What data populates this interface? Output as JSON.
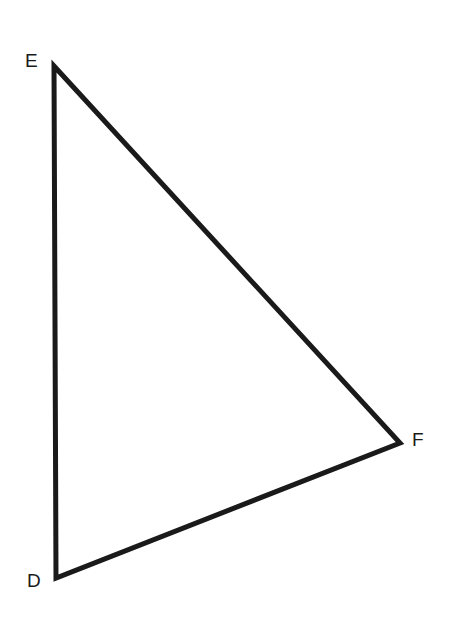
{
  "diagram": {
    "type": "triangle",
    "stroke_color": "#1a1a1a",
    "stroke_width": 5,
    "vertices": [
      {
        "label": "E",
        "x": 54,
        "y": 66,
        "label_x": 25,
        "label_y": 67
      },
      {
        "label": "F",
        "x": 400,
        "y": 443,
        "label_x": 412,
        "label_y": 446
      },
      {
        "label": "D",
        "x": 56,
        "y": 578,
        "label_x": 27,
        "label_y": 587
      }
    ]
  }
}
